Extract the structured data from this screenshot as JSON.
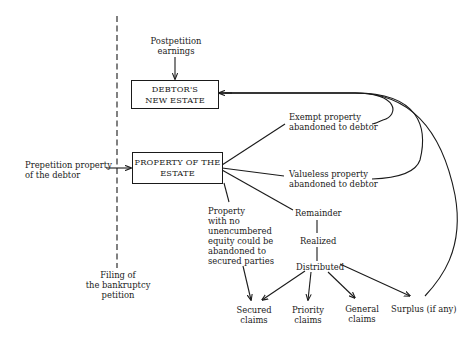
{
  "diagram": {
    "type": "flow-diagram",
    "boxes": {
      "new_estate": "DEBTOR'S\nNEW ESTATE",
      "property_estate": "PROPERTY OF THE\nESTATE"
    },
    "labels": {
      "postpetition": "Postpetition\nearnings",
      "prepetition": "Prepetition property\nof the debtor",
      "filing": "Filing of\nthe bankruptcy\npetition",
      "exempt": "Exempt property\nabandoned to debtor",
      "valueless": "Valueless property\nabandoned to debtor",
      "no_equity": "Property\nwith no\nunencumbered\nequity could be\nabandoned to\nsecured parties",
      "remainder": "Remainder",
      "realized": "Realized",
      "distributed": "Distributed",
      "secured": "Secured\nclaims",
      "priority": "Priority\nclaims",
      "general": "General\nclaims",
      "surplus": "Surplus (if any)"
    },
    "edges": [
      {
        "from": "Postpetition earnings",
        "to": "DEBTOR'S NEW ESTATE"
      },
      {
        "from": "Prepetition property of the debtor",
        "to": "PROPERTY OF THE ESTATE"
      },
      {
        "from": "PROPERTY OF THE ESTATE",
        "to": "Exempt property abandoned to debtor"
      },
      {
        "from": "PROPERTY OF THE ESTATE",
        "to": "Valueless property abandoned to debtor"
      },
      {
        "from": "PROPERTY OF THE ESTATE",
        "to": "Property with no unencumbered equity"
      },
      {
        "from": "PROPERTY OF THE ESTATE",
        "to": "Remainder"
      },
      {
        "from": "Remainder",
        "to": "Realized"
      },
      {
        "from": "Realized",
        "to": "Distributed"
      },
      {
        "from": "Distributed",
        "to": "Secured claims"
      },
      {
        "from": "Distributed",
        "to": "Priority claims"
      },
      {
        "from": "Distributed",
        "to": "General claims"
      },
      {
        "from": "Distributed",
        "to": "Surplus (if any)"
      },
      {
        "from": "Property with no unencumbered equity",
        "to": "Secured claims"
      },
      {
        "from": "Exempt property abandoned to debtor",
        "to": "DEBTOR'S NEW ESTATE"
      },
      {
        "from": "Valueless property abandoned to debtor",
        "to": "DEBTOR'S NEW ESTATE"
      },
      {
        "from": "Surplus (if any)",
        "to": "DEBTOR'S NEW ESTATE"
      }
    ]
  }
}
